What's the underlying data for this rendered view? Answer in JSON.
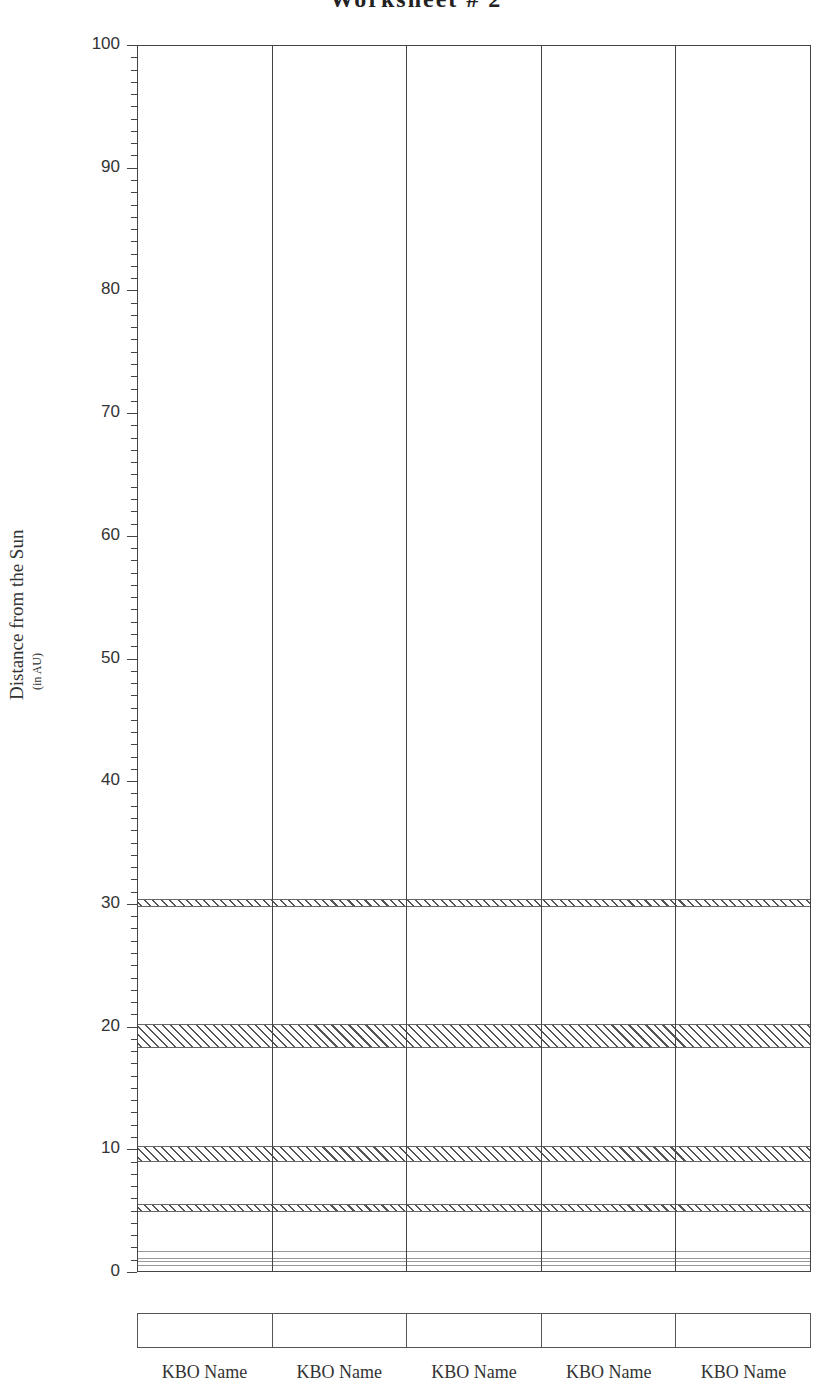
{
  "page": {
    "title": "Worksheet # 2"
  },
  "chart_data": {
    "type": "bar",
    "title": "Worksheet # 2",
    "xlabel": "",
    "ylabel": "Distance from the Sun",
    "ylabel_sub": "(in AU)",
    "ylim": [
      0,
      100
    ],
    "yticks": [
      0,
      10,
      20,
      30,
      40,
      50,
      60,
      70,
      80,
      90,
      100
    ],
    "minor_tick_step": 1,
    "grid": false,
    "categories": [
      "KBO Name",
      "KBO Name",
      "KBO Name",
      "KBO Name",
      "KBO Name"
    ],
    "values": [
      null,
      null,
      null,
      null,
      null
    ],
    "reference_bands": [
      {
        "label": "Jupiter orbit range",
        "from": 4.9,
        "to": 5.4,
        "pattern": "hatched"
      },
      {
        "label": "Saturn orbit range",
        "from": 9.0,
        "to": 10.1,
        "pattern": "hatched"
      },
      {
        "label": "Uranus orbit range",
        "from": 18.3,
        "to": 20.1,
        "pattern": "hatched"
      },
      {
        "label": "Neptune orbit range",
        "from": 29.8,
        "to": 30.3,
        "pattern": "hatched"
      }
    ],
    "reference_lines": [
      {
        "label": "Mercury",
        "y": 0.39
      },
      {
        "label": "Venus",
        "y": 0.72
      },
      {
        "label": "Earth",
        "y": 1.0
      },
      {
        "label": "Mars",
        "y": 1.52
      }
    ],
    "name_boxes": [
      "",
      "",
      "",
      "",
      ""
    ]
  }
}
